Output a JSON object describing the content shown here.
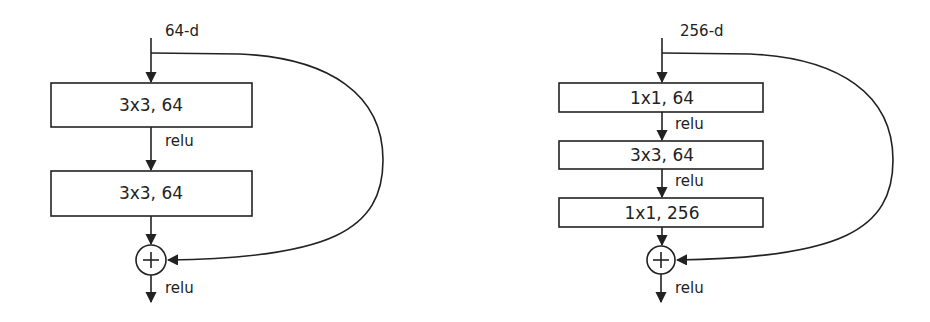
{
  "left_block": {
    "title": "Basic residual block",
    "input_label": "64-d",
    "layers": [
      {
        "label": "3x3, 64"
      },
      {
        "label": "3x3, 64"
      }
    ],
    "activations": [
      "relu"
    ],
    "output_activation": "relu",
    "merge_op": "+"
  },
  "right_block": {
    "title": "Bottleneck residual block",
    "input_label": "256-d",
    "layers": [
      {
        "label": "1x1, 64"
      },
      {
        "label": "3x3, 64"
      },
      {
        "label": "1x1, 256"
      }
    ],
    "activations": [
      "relu",
      "relu"
    ],
    "output_activation": "relu",
    "merge_op": "+"
  },
  "colors": {
    "stroke": "#222222",
    "background": "#ffffff"
  }
}
